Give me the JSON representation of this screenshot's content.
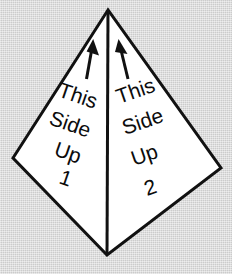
{
  "figure": {
    "kind": "kite-shaped-diagram",
    "background_color": "#d6d6d6",
    "fill_color": "#ffffff",
    "stroke_color": "#111111",
    "stroke_width_px": 3,
    "outline_points": "108,10 13,158 107,255 221,168",
    "center_line": {
      "x1": 108,
      "y1": 10,
      "x2": 107,
      "y2": 255
    }
  },
  "panels": [
    {
      "id": "panel-left",
      "number": "1",
      "arrow": {
        "name": "up-arrow",
        "direction": "up",
        "tilt_deg": -9
      },
      "lines": [
        {
          "text": "This",
          "rotation_deg": 19
        },
        {
          "text": "Side",
          "rotation_deg": 19
        },
        {
          "text": "Up",
          "rotation_deg": 19
        },
        {
          "text": "1",
          "rotation_deg": 19
        }
      ]
    },
    {
      "id": "panel-right",
      "number": "2",
      "arrow": {
        "name": "up-arrow",
        "direction": "up",
        "tilt_deg": 9
      },
      "lines": [
        {
          "text": "This",
          "rotation_deg": -19
        },
        {
          "text": "Side",
          "rotation_deg": -19
        },
        {
          "text": "Up",
          "rotation_deg": -19
        },
        {
          "text": "2",
          "rotation_deg": -19
        }
      ]
    }
  ]
}
